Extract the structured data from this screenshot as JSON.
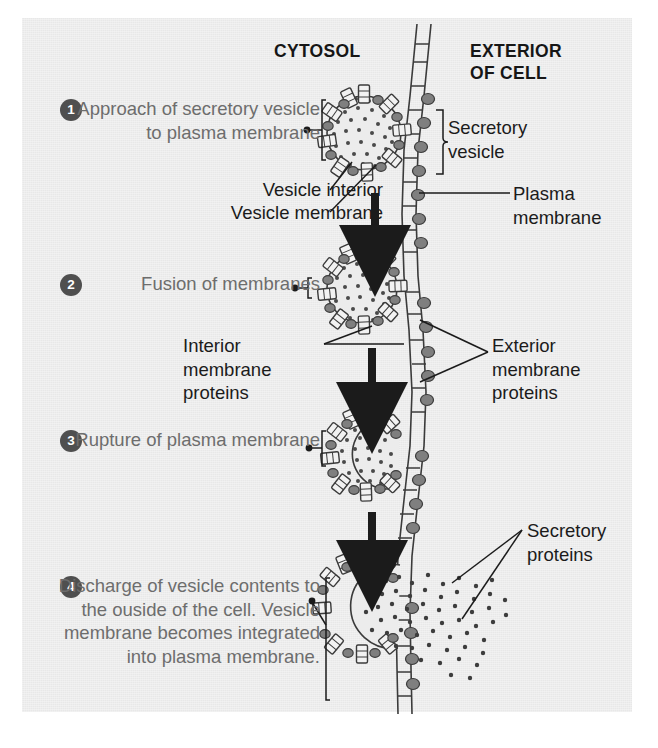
{
  "figure": {
    "title_hidden": "Exocytosis: discharge of secretory vesicle contents",
    "background_color": "#e8e8e8",
    "ink_color": "#1b1b1b",
    "step_text_color": "#6d6d6d",
    "badge_color": "#4f4f4f"
  },
  "headers": {
    "cytosol": "CYTOSOL",
    "exterior_line1": "EXTERIOR",
    "exterior_line2": "OF CELL"
  },
  "steps": [
    {
      "number": "1",
      "text": "Approach of secretory vesicle to plasma membrane"
    },
    {
      "number": "2",
      "text": "Fusion of membranes"
    },
    {
      "number": "3",
      "text": "Rupture of plasma membrane"
    },
    {
      "number": "4",
      "text": "Discharge of vesicle contents to the ouside of the cell. Vesicle membrane becomes integrated into plasma membrane."
    }
  ],
  "labels": {
    "secretory_vesicle": "Secretory vesicle",
    "plasma_membrane": "Plasma membrane",
    "vesicle_interior": "Vesicle interior",
    "vesicle_membrane": "Vesicle membrane",
    "interior_membrane_proteins": "Interior membrane proteins",
    "exterior_membrane_proteins": "Exterior membrane proteins",
    "secretory_proteins": "Secretory proteins"
  },
  "icons": {
    "down_arrow": "down-arrow-icon",
    "curly_brace": "curly-brace-icon",
    "leader_line": "leader-line-icon"
  }
}
